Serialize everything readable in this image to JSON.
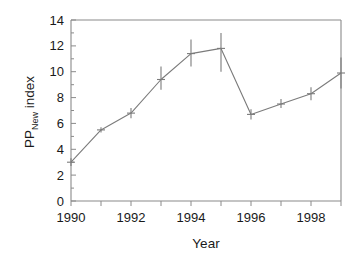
{
  "chart_data": {
    "type": "line",
    "title": "",
    "xlabel": "Year",
    "ylabel": "PP_New index",
    "ylabel_parts": {
      "main": "PP",
      "subscript": "New",
      "tail": " index"
    },
    "x": [
      1990,
      1991,
      1992,
      1993,
      1994,
      1995,
      1996,
      1997,
      1998,
      1999
    ],
    "values": [
      3.0,
      5.5,
      6.8,
      9.4,
      11.4,
      11.8,
      6.7,
      7.5,
      8.3,
      9.9
    ],
    "error_low": [
      2.7,
      5.3,
      6.4,
      8.6,
      10.4,
      10.0,
      6.3,
      7.2,
      7.8,
      8.7
    ],
    "error_high": [
      3.3,
      5.7,
      7.2,
      10.4,
      12.5,
      13.0,
      7.1,
      7.9,
      8.8,
      11.1
    ],
    "series": [
      {
        "name": "PP_New index",
        "values": [
          3.0,
          5.5,
          6.8,
          9.4,
          11.4,
          11.8,
          6.7,
          7.5,
          8.3,
          9.9
        ]
      }
    ],
    "xlim": [
      1989.5,
      1999.5
    ],
    "ylim": [
      0,
      14
    ],
    "ytick_values": [
      0,
      2,
      4,
      6,
      8,
      10,
      12,
      14
    ],
    "ytick_labels": [
      "0",
      "2",
      "4",
      "6",
      "8",
      "10",
      "12",
      "14"
    ],
    "xtick_values": [
      1990,
      1991,
      1992,
      1993,
      1994,
      1995,
      1996,
      1997,
      1998,
      1999
    ],
    "xtick_labels": [
      "1990",
      "",
      "1992",
      "",
      "1994",
      "",
      "1996",
      "",
      "1998",
      ""
    ],
    "grid": false,
    "legend": null,
    "markers": "none",
    "errorbars": "vertical",
    "colors": {
      "line": "#7b7b7b",
      "axis": "#8a8a8a",
      "text": "#1a1a1a",
      "background": "#ffffff"
    }
  },
  "labels": {
    "ylabel_main": "PP",
    "ylabel_sub": "New",
    "ylabel_tail": " index",
    "xlabel": "Year",
    "y0": "0",
    "y2": "2",
    "y4": "4",
    "y6": "6",
    "y8": "8",
    "y10": "10",
    "y12": "12",
    "y14": "14",
    "x1990": "1990",
    "x1992": "1992",
    "x1994": "1994",
    "x1996": "1996",
    "x1998": "1998"
  }
}
